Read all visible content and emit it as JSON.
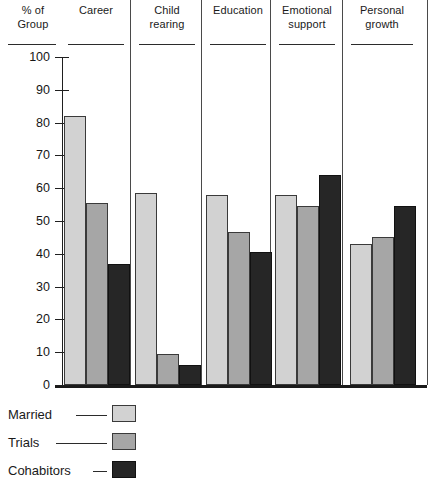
{
  "axis": {
    "title_line1": "% of",
    "title_line2": "Group",
    "tick_labels": [
      "100",
      "90",
      "80",
      "70",
      "60",
      "50",
      "40",
      "30",
      "20",
      "10",
      "0"
    ]
  },
  "legend": {
    "items": [
      {
        "label": "Married",
        "color": "#d2d2d2"
      },
      {
        "label": "Trials",
        "color": "#a6a6a6"
      },
      {
        "label": "Cohabitors",
        "color": "#262626"
      }
    ]
  },
  "chart_data": {
    "type": "bar",
    "title": "",
    "xlabel": "",
    "ylabel": "% of Group",
    "ylim": [
      0,
      100
    ],
    "ytick_step": 10,
    "grid": false,
    "legend_position": "bottom-left",
    "categories": [
      "Career",
      "Child rearing",
      "Education",
      "Emotional support",
      "Personal growth"
    ],
    "category_lines": [
      [
        "Career"
      ],
      [
        "Child",
        "rearing"
      ],
      [
        "Education"
      ],
      [
        "Emotional",
        "support"
      ],
      [
        "Personal",
        "growth"
      ]
    ],
    "series": [
      {
        "name": "Married",
        "color": "#d2d2d2",
        "values": [
          82,
          58.5,
          58,
          58,
          43
        ]
      },
      {
        "name": "Trials",
        "color": "#a6a6a6",
        "values": [
          55.5,
          9.5,
          46.5,
          54.5,
          45
        ]
      },
      {
        "name": "Cohabitors",
        "color": "#262626",
        "values": [
          37,
          6,
          40.5,
          64,
          54.5
        ]
      }
    ]
  }
}
